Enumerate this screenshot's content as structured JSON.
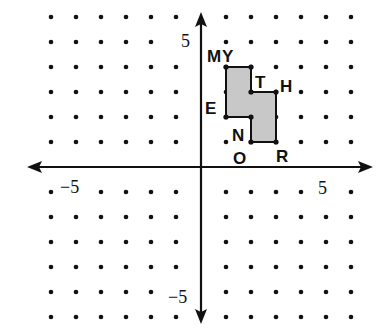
{
  "diagram": {
    "type": "coordinate-grid",
    "origin_px": [
      201,
      167
    ],
    "unit_px": 25,
    "grid_range": {
      "x": [
        -6,
        6
      ],
      "y": [
        -6,
        6
      ]
    },
    "axis_labels": {
      "x_neg": "−5",
      "x_pos": "5",
      "y_pos": "5",
      "y_neg": "−5"
    },
    "polygon": {
      "fill": "#c8c8c8",
      "stroke": "#111111",
      "vertices": [
        [
          1,
          4
        ],
        [
          2,
          4
        ],
        [
          2,
          3
        ],
        [
          3,
          3
        ],
        [
          3,
          1
        ],
        [
          2,
          1
        ],
        [
          2,
          2
        ],
        [
          1,
          2
        ]
      ]
    },
    "point_labels": [
      {
        "text": "M",
        "x": 214,
        "y": 62
      },
      {
        "text": "Y",
        "x": 230,
        "y": 62
      },
      {
        "text": "T",
        "x": 262,
        "y": 88
      },
      {
        "text": "H",
        "x": 288,
        "y": 92
      },
      {
        "text": "E",
        "x": 212,
        "y": 114
      },
      {
        "text": "N",
        "x": 240,
        "y": 141
      },
      {
        "text": "O",
        "x": 241,
        "y": 164
      },
      {
        "text": "R",
        "x": 284,
        "y": 162
      }
    ],
    "colors": {
      "ink": "#111111",
      "background": "#ffffff",
      "shade": "#c8c8c8"
    }
  }
}
